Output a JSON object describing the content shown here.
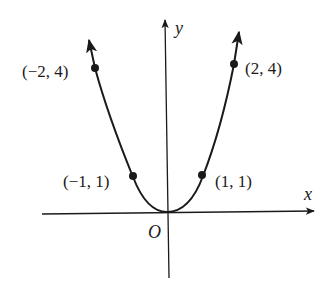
{
  "figure": {
    "type": "parabola",
    "equation": "y = x^2",
    "axes": {
      "x_label": "x",
      "y_label": "y",
      "origin_label": "O"
    },
    "points": [
      {
        "label": "(−2, 4)",
        "x": -2,
        "y": 4
      },
      {
        "label": "(−1, 1)",
        "x": -1,
        "y": 1
      },
      {
        "label": "(1, 1)",
        "x": 1,
        "y": 1
      },
      {
        "label": "(2, 4)",
        "x": 2,
        "y": 4
      }
    ],
    "colors": {
      "stroke": "#1a1a1a",
      "background": "#ffffff"
    }
  }
}
